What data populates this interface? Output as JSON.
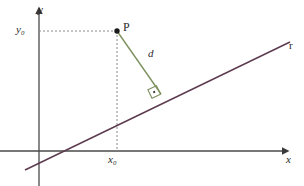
{
  "figure": {
    "title_cut_off": "",
    "background_color": "#ffffff",
    "width": 304,
    "height": 186
  },
  "colors": {
    "axis": "#4a4a4a",
    "line_r": "#5c3a4e",
    "segment_d": "#7d9160",
    "dashed_guide": "#8a8a8a",
    "label_text": "#2b2b2b",
    "point_fill": "#1a1a1a"
  },
  "axes": {
    "x_axis": {
      "label": "x",
      "name": "x-axis",
      "y_pixel": 151,
      "x_start": 0,
      "x_end": 290,
      "arrow": "right"
    },
    "y_axis": {
      "label": "y",
      "name": "y-axis",
      "x_pixel": 39,
      "y_start": 8,
      "y_end": 186,
      "arrow": "up"
    },
    "origin": {
      "x_pixel": 39,
      "y_pixel": 151
    }
  },
  "point": {
    "label": "P",
    "x_pixel": 117,
    "y_pixel": 31,
    "radius": 2.6
  },
  "guides": {
    "horizontal": {
      "label": "y₀",
      "label_base": "y",
      "label_sub": "0",
      "from_x": 39,
      "to_x": 117,
      "y_pixel": 31
    },
    "vertical": {
      "label": "x₀",
      "label_base": "x",
      "label_sub": "0",
      "x_pixel": 117,
      "from_y": 31,
      "to_y": 151
    },
    "dash_pattern": "2,2"
  },
  "line_r": {
    "label": "r",
    "x1": 25,
    "y1": 170,
    "x2": 288,
    "y2": 43,
    "stroke_width": 1.3
  },
  "segment_d": {
    "label": "d",
    "x1": 117,
    "y1": 31,
    "x2": 160,
    "y2": 93,
    "stroke_width": 1.3,
    "meaning": "distance from point P to line r"
  },
  "right_angle": {
    "name": "right-angle-marker",
    "x_pixel": 160,
    "y_pixel": 93,
    "size": 9,
    "has_center_dot": true
  }
}
